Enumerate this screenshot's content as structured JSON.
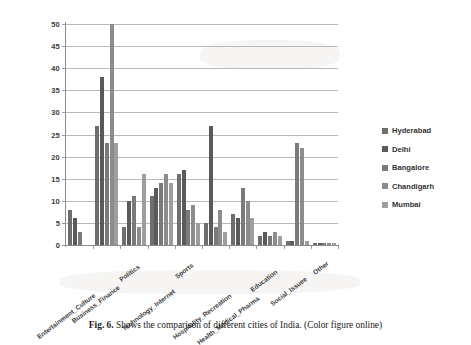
{
  "figure": {
    "caption_prefix": "Fig. 6.",
    "caption_text": "Shows the comparison of different cities of India. (Color figure online)"
  },
  "legend": {
    "position": "right",
    "items": [
      {
        "label": "Hyderabad",
        "color": "#6e6e6e"
      },
      {
        "label": "Delhi",
        "color": "#5a5a5a"
      },
      {
        "label": "Bangalore",
        "color": "#7a7a7a"
      },
      {
        "label": "Chandigarh",
        "color": "#8c8c8c"
      },
      {
        "label": "Mumbai",
        "color": "#9e9e9e"
      }
    ]
  },
  "chart_data": {
    "type": "bar",
    "title": "",
    "xlabel": "",
    "ylabel": "",
    "ylim": [
      0,
      50
    ],
    "ytick_step": 5,
    "yticks": [
      50,
      45,
      40,
      35,
      30,
      25,
      20,
      15,
      10,
      5,
      0
    ],
    "grid": true,
    "legend_position": "right",
    "categories": [
      "Entertainment_Culture",
      "Business_Finance",
      "Politics",
      "Technology_Internet",
      "Sports",
      "Hospitality_Recreation",
      "Health_Medical_Pharma",
      "Education",
      "Social_Issuee",
      "Other"
    ],
    "series": [
      {
        "name": "Hyderabad",
        "color": "#6e6e6e",
        "values": [
          8,
          27,
          4,
          11,
          16,
          5,
          7,
          2,
          1,
          0.4
        ]
      },
      {
        "name": "Delhi",
        "color": "#5a5a5a",
        "values": [
          6,
          38,
          10,
          13,
          17,
          27,
          6,
          3,
          1,
          0.4
        ]
      },
      {
        "name": "Bangalore",
        "color": "#7a7a7a",
        "values": [
          3,
          23,
          11,
          14,
          8,
          4,
          13,
          2,
          23,
          0.4
        ]
      },
      {
        "name": "Chandigarh",
        "color": "#8c8c8c",
        "values": [
          0,
          50,
          4,
          16,
          9,
          8,
          10,
          3,
          22,
          0.4
        ]
      },
      {
        "name": "Mumbai",
        "color": "#9e9e9e",
        "values": [
          0,
          23,
          16,
          14,
          5,
          3,
          6,
          2,
          1,
          0.4
        ]
      }
    ]
  }
}
